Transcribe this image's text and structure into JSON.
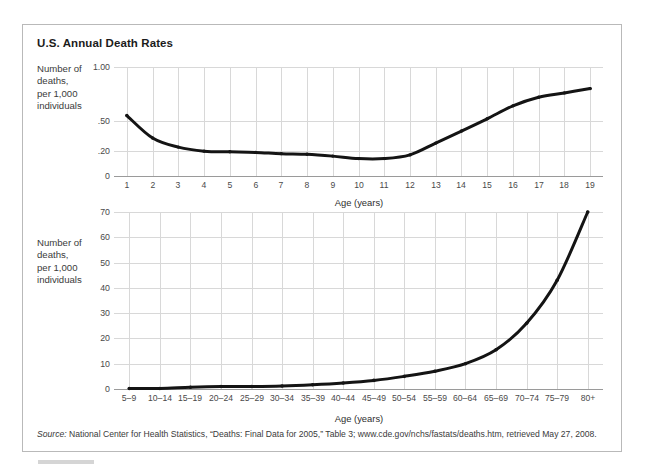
{
  "figure": {
    "title": "U.S. Annual Death Rates",
    "source_prefix": "Source:",
    "source_text": " National Center for Health Statistics, “Deaths: Final Data for 2005,” Table 3; www.cde.gov/nchs/fastats/deaths.htm, retrieved May 27, 2008."
  },
  "chart_data": [
    {
      "type": "line",
      "title": "U.S. Annual Death Rates",
      "xlabel": "Age (years)",
      "ylabel": "Number of deaths, per 1,000 individuals",
      "ylabel_lines": [
        "Number of",
        "deaths,",
        "per 1,000",
        "individuals"
      ],
      "categories": [
        "1",
        "2",
        "3",
        "4",
        "5",
        "6",
        "7",
        "8",
        "9",
        "10",
        "11",
        "12",
        "13",
        "14",
        "15",
        "16",
        "17",
        "18",
        "19"
      ],
      "x": [
        1,
        2,
        3,
        4,
        5,
        6,
        7,
        8,
        9,
        10,
        11,
        12,
        13,
        14,
        15,
        16,
        17,
        18,
        19
      ],
      "values": [
        0.55,
        0.33,
        0.24,
        0.2,
        0.195,
        0.19,
        0.18,
        0.175,
        0.16,
        0.14,
        0.14,
        0.17,
        0.28,
        0.4,
        0.52,
        0.64,
        0.72,
        0.76,
        0.8
      ],
      "ytick_labels": [
        "1.00",
        ".50",
        ".20",
        "0"
      ],
      "ytick_values": [
        1.0,
        0.5,
        0.2,
        0.0
      ],
      "ylim": [
        0,
        1.0
      ],
      "y_scale": "nonlinear",
      "grid": true,
      "legend": "none"
    },
    {
      "type": "line",
      "xlabel": "Age (years)",
      "ylabel": "Number of deaths, per 1,000 individuals",
      "ylabel_lines": [
        "Number of",
        "deaths,",
        "per 1,000",
        "individuals"
      ],
      "categories": [
        "5–9",
        "10–14",
        "15–19",
        "20–24",
        "25–29",
        "30–34",
        "35–39",
        "40–44",
        "45–49",
        "50–54",
        "55–59",
        "60–64",
        "65–69",
        "70–74",
        "75–79",
        "80+"
      ],
      "values": [
        0.2,
        0.2,
        0.7,
        1.0,
        1.0,
        1.2,
        1.7,
        2.4,
        3.4,
        5.0,
        7.0,
        10.0,
        15.5,
        26.0,
        43.0,
        70.0
      ],
      "ytick_labels": [
        "0",
        "10",
        "20",
        "30",
        "40",
        "50",
        "60",
        "70"
      ],
      "ytick_values": [
        0,
        10,
        20,
        30,
        40,
        50,
        60,
        70
      ],
      "ylim": [
        0,
        70
      ],
      "y_scale": "linear",
      "grid": true,
      "legend": "none"
    }
  ]
}
